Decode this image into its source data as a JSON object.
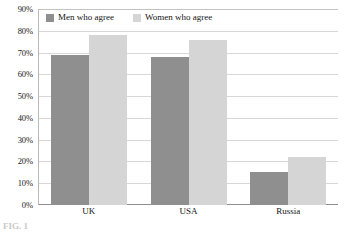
{
  "chart_data": {
    "type": "bar",
    "title": "",
    "subtitle": "",
    "xlabel": "",
    "ylabel": "",
    "categories": [
      "UK",
      "USA",
      "Russia"
    ],
    "series": [
      {
        "name": "Men who agree",
        "color": "#8f8f8f",
        "values": [
          69,
          68,
          15
        ]
      },
      {
        "name": "Women who agree",
        "color": "#d5d5d5",
        "values": [
          78,
          76,
          22
        ]
      }
    ],
    "ylim": [
      0,
      90
    ],
    "ytick_values": [
      90,
      80,
      70,
      60,
      50,
      40,
      30,
      20,
      10,
      0
    ],
    "ytick_labels": [
      "90%",
      "80%",
      "70%",
      "60%",
      "50%",
      "40%",
      "30%",
      "20%",
      "10%",
      "0%"
    ],
    "grid": true,
    "grid_axis": "y",
    "legend_position": "top-left-inside",
    "bar_mode": "grouped"
  },
  "caption": {
    "text": "FIG. 1"
  }
}
